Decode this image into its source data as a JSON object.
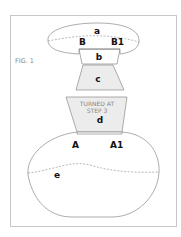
{
  "figure": {
    "caption": "FIG. 1",
    "note_line1": "TURNED AT",
    "note_line2": "STEP 3"
  },
  "labels": {
    "a": "a",
    "b": "b",
    "c": "c",
    "d": "d",
    "e": "e",
    "B": "B",
    "B1": "B1",
    "A": "A",
    "A1": "A1"
  },
  "colors": {
    "frame": "#c8c8c8",
    "outline": "#8a8a8a",
    "fill_shaded": "#ececec",
    "text": "#111111",
    "caption": "#888888"
  }
}
